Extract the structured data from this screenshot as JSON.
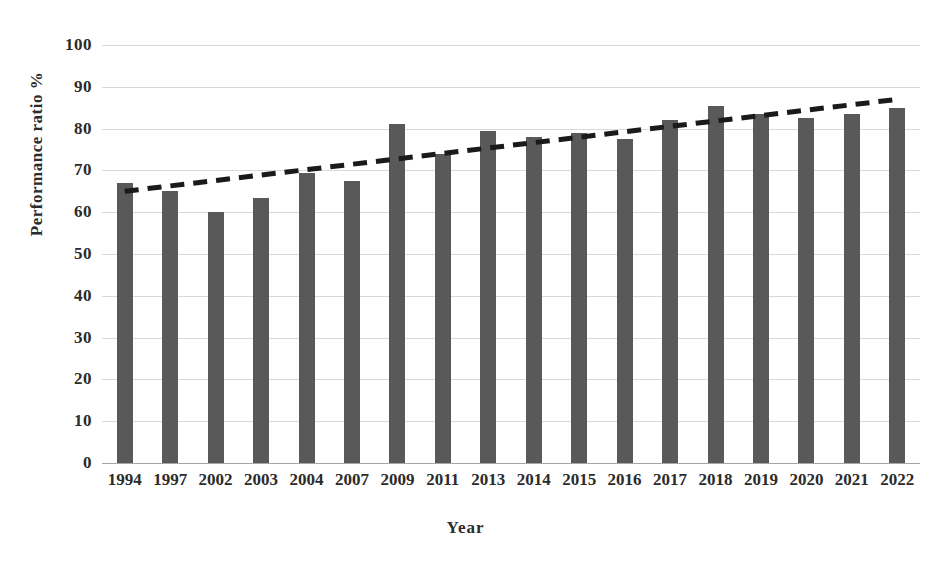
{
  "chart_data": {
    "type": "bar",
    "title": "",
    "subtitle": "",
    "xlabel": "Year",
    "ylabel": "Performance ratio %",
    "categories": [
      "1994",
      "1997",
      "2002",
      "2003",
      "2004",
      "2007",
      "2009",
      "2011",
      "2013",
      "2014",
      "2015",
      "2016",
      "2017",
      "2018",
      "2019",
      "2020",
      "2021",
      "2022"
    ],
    "series": [
      {
        "name": "Performance ratio %",
        "values": [
          67,
          65,
          60,
          63.5,
          69.5,
          67.5,
          81,
          74,
          79.5,
          78,
          79,
          77.5,
          82,
          85.5,
          83.5,
          82.5,
          83.5,
          85
        ],
        "color": "#595959"
      }
    ],
    "trendline": {
      "name": "Linear trend",
      "style": "dashed",
      "color": "#1a1a1a",
      "start": {
        "x_category": "1994",
        "y": 65.0
      },
      "end": {
        "x_category": "2022",
        "y": 87.0
      }
    },
    "ylim": [
      0,
      100
    ],
    "ytick_step": 10,
    "ytick_labels": [
      "100",
      "90",
      "80",
      "70",
      "60",
      "50",
      "40",
      "30",
      "20",
      "10",
      "0"
    ],
    "ytick_values": [
      100,
      90,
      80,
      70,
      60,
      50,
      40,
      30,
      20,
      10,
      0
    ],
    "grid": {
      "horizontal": true,
      "vertical": false,
      "color": "#d9d9d9"
    },
    "legend": {
      "visible": false,
      "position": "none"
    },
    "axis_line_color": "#a6a6a6",
    "background": "#ffffff"
  }
}
